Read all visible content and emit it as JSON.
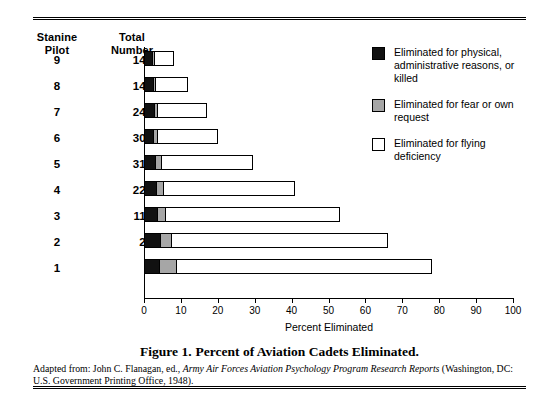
{
  "table": {
    "headers": {
      "stanine": "Stanine\nPilot",
      "stanine_line1": "Stanine",
      "stanine_line2": "Pilot",
      "total_line1": "Total",
      "total_line2": "Number"
    },
    "rows": [
      {
        "stanine": "9",
        "total": "14,682"
      },
      {
        "stanine": "8",
        "total": "14,286"
      },
      {
        "stanine": "7",
        "total": "24,367"
      },
      {
        "stanine": "6",
        "total": "30,066"
      },
      {
        "stanine": "5",
        "total": "31,091"
      },
      {
        "stanine": "4",
        "total": "22,827"
      },
      {
        "stanine": "3",
        "total": "11,471"
      },
      {
        "stanine": "2",
        "total": "2,239"
      },
      {
        "stanine": "1",
        "total": "904"
      }
    ]
  },
  "legend": {
    "items": [
      {
        "swatch": "black",
        "label": "Eliminated for physical, administrative reasons, or killed"
      },
      {
        "swatch": "gray",
        "label": "Eliminated for fear or own request"
      },
      {
        "swatch": "white",
        "label": "Eliminated for flying deficiency"
      }
    ]
  },
  "caption": {
    "figure_number": "Figure 1.",
    "title": "Percent of Aviation Cadets Eliminated."
  },
  "source": {
    "prefix": "Adapted from: John C. Flanagan, ed., ",
    "italic": "Army Air Forces Aviation Psychology Program Research Reports",
    "suffix": " (Washington, DC: U.S. Government Printing Office, 1948)."
  },
  "colors": {
    "black_segment": "#111111",
    "gray_segment": "#a6a6a6",
    "white_segment": "#ffffff",
    "axis": "#000000"
  },
  "chart_data": {
    "type": "bar",
    "orientation": "horizontal",
    "stacked": true,
    "title": "Percent of Aviation Cadets Eliminated",
    "xlabel": "Percent Eliminated",
    "ylabel": "Stanine Pilot",
    "xlim": [
      0,
      100
    ],
    "xticks": [
      0,
      10,
      20,
      30,
      40,
      50,
      60,
      70,
      80,
      90,
      100
    ],
    "xtick_labels": [
      "0",
      "10",
      "20",
      "30",
      "40",
      "50",
      "60",
      "70",
      "80",
      "90",
      "100"
    ],
    "grid": false,
    "legend_position": "top-right",
    "categories": [
      "9",
      "8",
      "7",
      "6",
      "5",
      "4",
      "3",
      "2",
      "1"
    ],
    "category_totals": [
      "14,682",
      "14,286",
      "24,367",
      "30,066",
      "31,091",
      "22,827",
      "11,471",
      "2,239",
      "904"
    ],
    "series": [
      {
        "name": "Eliminated for physical, administrative reasons, or killed",
        "color": "#111111",
        "values": [
          2.0,
          2.2,
          2.4,
          2.2,
          2.8,
          3.0,
          3.2,
          4.2,
          3.8
        ]
      },
      {
        "name": "Eliminated for fear or own request",
        "color": "#a6a6a6",
        "values": [
          0.8,
          1.0,
          1.2,
          1.4,
          2.0,
          2.2,
          2.6,
          3.1,
          5.0
        ]
      },
      {
        "name": "Eliminated for flying deficiency",
        "color": "#ffffff",
        "values": [
          5.2,
          8.8,
          13.4,
          16.4,
          24.7,
          35.8,
          47.2,
          58.7,
          69.2
        ]
      }
    ],
    "totals_percent": [
      8.0,
      12.0,
      17.0,
      20.0,
      29.5,
      41.0,
      53.0,
      66.0,
      78.0
    ]
  }
}
